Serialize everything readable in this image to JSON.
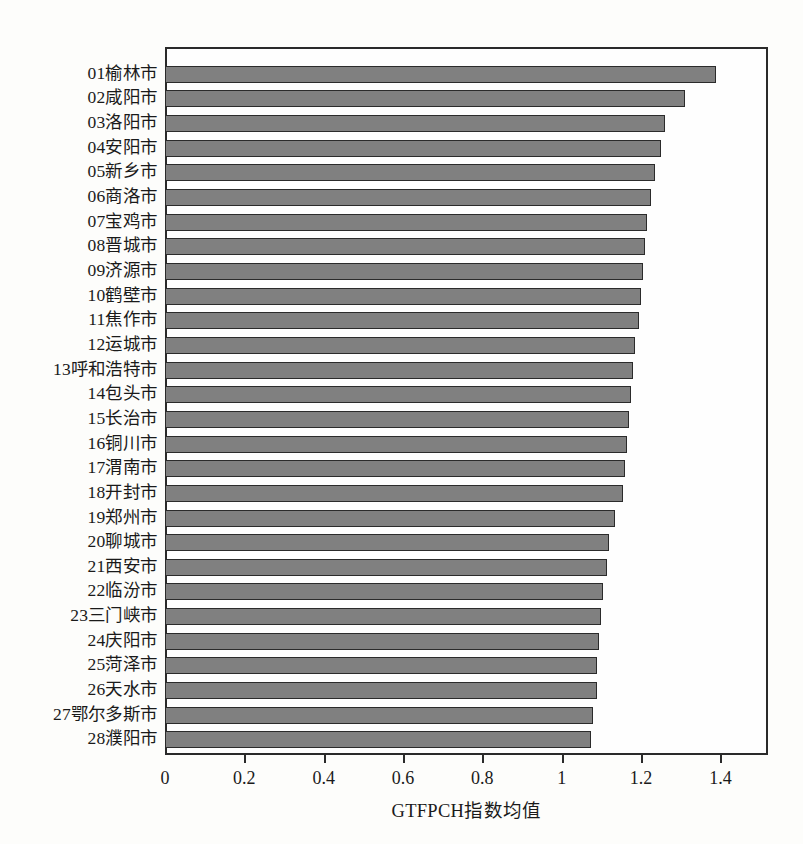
{
  "chart_data": {
    "type": "bar",
    "orientation": "horizontal",
    "title": "",
    "xlabel": "GTFPCH指数均值",
    "ylabel": "",
    "xlim": [
      0,
      1.52
    ],
    "xticks": [
      0,
      0.2,
      0.4,
      0.6,
      0.8,
      1,
      1.2,
      1.4
    ],
    "xtick_labels": [
      "0",
      "0.2",
      "0.4",
      "0.6",
      "0.8",
      "1",
      "1.2",
      "1.4"
    ],
    "grid": false,
    "legend": null,
    "bar_color": "#808080",
    "bar_edge_color": "#2b2b2b",
    "categories": [
      "01榆林市",
      "02咸阳市",
      "03洛阳市",
      "04安阳市",
      "05新乡市",
      "06商洛市",
      "07宝鸡市",
      "08晋城市",
      "09济源市",
      "10鹤壁市",
      "11焦作市",
      "12运城市",
      "13呼和浩特市",
      "14包头市",
      "15长治市",
      "16铜川市",
      "17渭南市",
      "18开封市",
      "19郑州市",
      "20聊城市",
      "21西安市",
      "22临汾市",
      "23三门峡市",
      "24庆阳市",
      "25菏泽市",
      "26天水市",
      "27鄂尔多斯市",
      "28濮阳市"
    ],
    "values": [
      1.39,
      1.31,
      1.26,
      1.25,
      1.235,
      1.225,
      1.215,
      1.21,
      1.205,
      1.2,
      1.195,
      1.185,
      1.18,
      1.175,
      1.17,
      1.165,
      1.16,
      1.155,
      1.135,
      1.12,
      1.115,
      1.105,
      1.1,
      1.095,
      1.09,
      1.09,
      1.08,
      1.075
    ]
  }
}
